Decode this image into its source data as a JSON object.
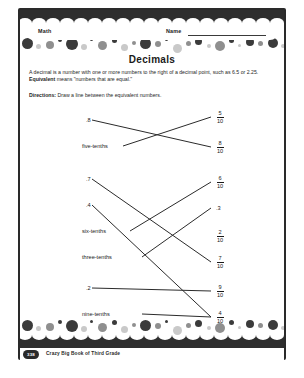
{
  "header": {
    "subject_label": "Math",
    "name_label": "Name"
  },
  "title": "Decimals",
  "definition_part1": "A decimal is a number with one or more numbers to the right of a decimal point, such as 6.5 or 2.25. ",
  "definition_bold": "Equivalent",
  "definition_part2": " means \"numbers that are equal.\"",
  "directions_label": "Directions:",
  "directions_text": " Draw a line between the equivalent numbers.",
  "left_column": [
    {
      "label": ".8"
    },
    {
      "label": "five-tenths"
    },
    {
      "label": ".7"
    },
    {
      "label": ".4"
    },
    {
      "label": "six-tenths"
    },
    {
      "label": "three-tenths"
    },
    {
      "label": ".2"
    },
    {
      "label": "nine-tenths"
    }
  ],
  "right_column": [
    {
      "numerator": "5",
      "denominator": "10",
      "plain": ""
    },
    {
      "numerator": "8",
      "denominator": "10",
      "plain": ""
    },
    {
      "numerator": "6",
      "denominator": "10",
      "plain": ""
    },
    {
      "numerator": "",
      "denominator": "",
      "plain": ".3"
    },
    {
      "numerator": "2",
      "denominator": "10",
      "plain": ""
    },
    {
      "numerator": "7",
      "denominator": "10",
      "plain": ""
    },
    {
      "numerator": "9",
      "denominator": "10",
      "plain": ""
    },
    {
      "numerator": "4",
      "denominator": "10",
      "plain": ""
    }
  ],
  "footer": {
    "page_number": "338",
    "book_title": "Crazy Big Book of Third Grade"
  },
  "colors": {
    "frame": "#2a2a2a",
    "ink": "#1a1a1a",
    "dot_dark": "#3b3b3b",
    "dot_mid": "#8f8f8f",
    "dot_light": "#c9c9c9"
  }
}
